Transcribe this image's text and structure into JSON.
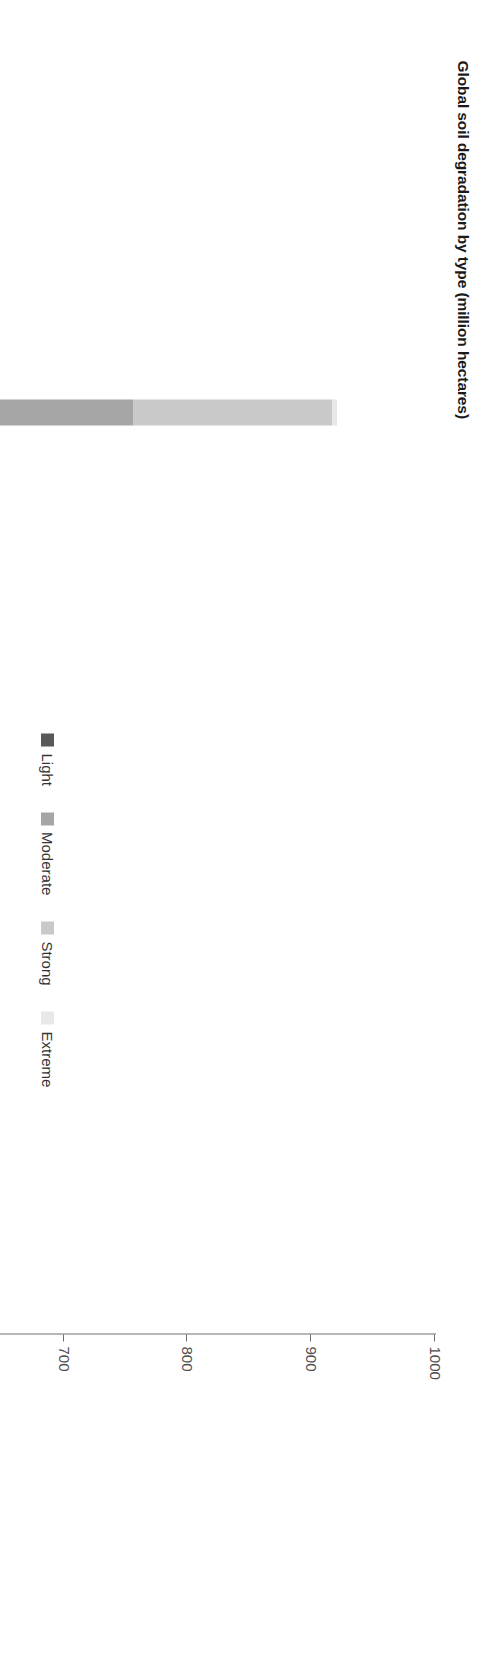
{
  "chart_data": {
    "type": "bar",
    "title": "Global soil degradation by type (million hectares)",
    "xlabel": "",
    "ylabel": "",
    "orientation": "vertical-stacked",
    "stacked": true,
    "grid": false,
    "legend_position": "inside-right",
    "ylim": [
      0,
      1000
    ],
    "yticks": [
      0,
      100,
      200,
      300,
      400,
      500,
      600,
      700,
      800,
      900,
      1000
    ],
    "ytick_labels": [
      "0",
      "100",
      "200",
      "300",
      "400",
      "500",
      "600",
      "700",
      "800",
      "900",
      "1000"
    ],
    "group_labels": [
      "WATER",
      "WIND",
      "CHEMICAL",
      "PHYSICAL"
    ],
    "categories": [
      "Loss of topsoil",
      "Terrain deformation",
      "Loss of topsoil",
      "Terrain deformation",
      "Overblowing",
      "Loss of nutrients",
      "Salinisation",
      "Pollution",
      "Acidification",
      "Compaction",
      "Waterlogging",
      "Subsistence organic soils"
    ],
    "series": [
      {
        "name": "Light",
        "color": "#595959",
        "values": [
          301,
          38,
          230,
          41,
          0,
          52,
          34,
          17,
          4,
          34,
          6,
          3
        ]
      },
      {
        "name": "Moderate",
        "color": "#a6a6a6",
        "values": [
          454,
          83,
          213,
          30,
          10,
          63,
          20,
          4,
          2,
          34,
          4,
          2
        ]
      },
      {
        "name": "Strong",
        "color": "#c9c9c9",
        "values": [
          161,
          46,
          1,
          9,
          0,
          19,
          18,
          0,
          1,
          0,
          1,
          0
        ]
      },
      {
        "name": "Extreme",
        "color": "#e8e8e8",
        "values": [
          4,
          0,
          0,
          0,
          0,
          0,
          0,
          0,
          0,
          0,
          0,
          0
        ]
      }
    ],
    "legend_entries": [
      {
        "label": "Light",
        "color": "#595959"
      },
      {
        "label": "Moderate",
        "color": "#a6a6a6"
      },
      {
        "label": "Strong",
        "color": "#c9c9c9"
      },
      {
        "label": "Extreme",
        "color": "#e8e8e8"
      }
    ],
    "axis_color": "#6f6f6f",
    "text_color": "#333333"
  }
}
